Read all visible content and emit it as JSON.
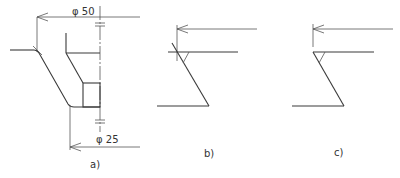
{
  "figures": [
    {
      "id": "a",
      "caption": "a)",
      "dimensions": [
        {
          "label": "φ 50"
        },
        {
          "label": "φ 25"
        }
      ]
    },
    {
      "id": "b",
      "caption": "b)"
    },
    {
      "id": "c",
      "caption": "c)"
    }
  ],
  "colors": {
    "line": "#3a3a3a",
    "background": "#ffffff"
  }
}
